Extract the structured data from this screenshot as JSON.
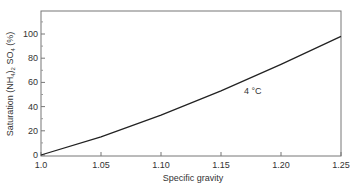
{
  "chart_data": {
    "type": "line",
    "title": "",
    "xlabel": "Specific gravity",
    "ylabel": "Saturation (NH4)2 SO4 (%)",
    "xlim": [
      1.0,
      1.25
    ],
    "ylim": [
      0,
      120
    ],
    "xticks": [
      "1.0",
      "1.05",
      "1.10",
      "1.15",
      "1.20",
      "1.25"
    ],
    "yticks": [
      "0",
      "20",
      "40",
      "60",
      "80",
      "100"
    ],
    "grid": false,
    "legend": null,
    "annotations": [
      {
        "text": "4 °C",
        "x": 1.175,
        "y": 58
      }
    ],
    "series": [
      {
        "name": "4 °C",
        "x": [
          1.0,
          1.05,
          1.1,
          1.15,
          1.2,
          1.25
        ],
        "y": [
          0,
          15,
          33,
          53,
          75,
          98
        ]
      }
    ]
  },
  "labels": {
    "xlabel": "Specific gravity",
    "ylabel_main": "Saturation (NH",
    "ylabel_sub1": "4",
    "ylabel_mid": ")",
    "ylabel_sub2": "2",
    "ylabel_end1": " SO",
    "ylabel_sub3": "4",
    "ylabel_end2": " (%)",
    "annotation": "4 °C",
    "xticks": [
      "1.0",
      "1.05",
      "1.10",
      "1.15",
      "1.20",
      "1.25"
    ],
    "yticks": [
      "0",
      "20",
      "40",
      "60",
      "80",
      "100"
    ]
  }
}
